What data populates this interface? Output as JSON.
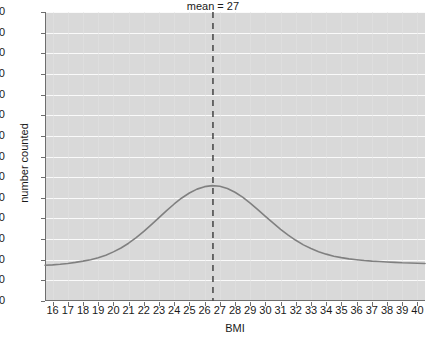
{
  "chart_data": {
    "type": "line",
    "title": "",
    "xlabel": "BMI",
    "ylabel": "number counted",
    "xlim": [
      15.5,
      40.5
    ],
    "ylim": [
      0,
      140
    ],
    "grid": "horizontal-white-major",
    "legend": null,
    "xticks": [
      16,
      17,
      18,
      19,
      20,
      21,
      22,
      23,
      24,
      25,
      26,
      27,
      28,
      29,
      30,
      31,
      32,
      33,
      34,
      35,
      36,
      37,
      38,
      39,
      40
    ],
    "yticks": [
      0,
      10,
      20,
      30,
      40,
      50,
      60,
      70,
      80,
      90,
      100,
      110,
      120,
      130,
      140
    ],
    "series": [
      {
        "name": "BMI distribution",
        "color": "#808080",
        "x": [
          15.5,
          16,
          16.5,
          17,
          17.5,
          18,
          18.5,
          19,
          19.5,
          20,
          20.5,
          21,
          21.5,
          22,
          22.5,
          23,
          23.5,
          24,
          24.5,
          25,
          25.5,
          26,
          26.5,
          27,
          27.5,
          28,
          28.5,
          29,
          29.5,
          30,
          30.5,
          31,
          31.5,
          32,
          32.5,
          33,
          33.5,
          34,
          34.5,
          35,
          35.5,
          36,
          36.5,
          37,
          37.5,
          38,
          38.5,
          39,
          39.5,
          40,
          40.5
        ],
        "y": [
          17.3,
          17.5,
          17.8,
          18.2,
          18.7,
          19.3,
          20.0,
          21.0,
          22.2,
          23.8,
          25.7,
          28.0,
          30.7,
          33.7,
          37.0,
          40.4,
          43.8,
          47.0,
          49.9,
          52.3,
          54.2,
          55.4,
          55.9,
          55.6,
          54.5,
          52.7,
          50.3,
          47.4,
          44.3,
          41.0,
          37.8,
          34.7,
          31.9,
          29.4,
          27.2,
          25.4,
          23.9,
          22.7,
          21.7,
          21.0,
          20.4,
          20.0,
          19.6,
          19.3,
          19.1,
          18.9,
          18.7,
          18.5,
          18.4,
          18.3,
          18.2
        ]
      }
    ],
    "annotations": [
      {
        "name": "mean-line",
        "label": "mean = 27",
        "x_value": 26.55,
        "style": "dashed-vertical",
        "color": "#4d4d4d"
      }
    ],
    "colors": {
      "plot_background": "#d9d9d9",
      "gridline": "#fafafa",
      "axis": "#6e6e6e",
      "text": "#1a1a1a",
      "curve": "#808080",
      "mean_line": "#4d4d4d",
      "page_background": "#ffffff"
    }
  }
}
